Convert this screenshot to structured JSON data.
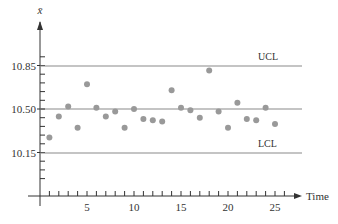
{
  "chart_data": {
    "type": "scatter",
    "title": "",
    "xlabel": "Time",
    "ylabel": "x̄",
    "xlim": [
      0,
      27
    ],
    "ylim": [
      9.9,
      11.1
    ],
    "x_ticks": [
      5,
      10,
      15,
      20,
      25
    ],
    "x_minor_ticks_step": 1,
    "y_ticks": [
      10.15,
      10.5,
      10.85
    ],
    "y_minor_ticks_step": 0.07,
    "grid": false,
    "legend": null,
    "reference_lines": [
      {
        "name": "UCL",
        "value": 10.83,
        "label": "UCL"
      },
      {
        "name": "CL",
        "value": 10.5,
        "label": ""
      },
      {
        "name": "LCL",
        "value": 10.17,
        "label": "LCL"
      }
    ],
    "series": [
      {
        "name": "sample means",
        "color": "#999999",
        "x": [
          1,
          2,
          3,
          4,
          5,
          6,
          7,
          8,
          9,
          10,
          11,
          12,
          13,
          14,
          15,
          16,
          17,
          18,
          19,
          20,
          21,
          22,
          23,
          24,
          25
        ],
        "values": [
          10.27,
          10.44,
          10.52,
          10.35,
          10.7,
          10.51,
          10.44,
          10.48,
          10.35,
          10.5,
          10.42,
          10.41,
          10.4,
          10.65,
          10.51,
          10.49,
          10.43,
          10.81,
          10.48,
          10.35,
          10.55,
          10.42,
          10.41,
          10.51,
          10.38
        ]
      }
    ]
  },
  "labels": {
    "y_axis": "x̄",
    "x_axis": "Time",
    "ucl": "UCL",
    "lcl": "LCL",
    "y_ticks": [
      "10.85",
      "10.50",
      "10.15"
    ],
    "x_ticks": [
      "5",
      "10",
      "15",
      "20",
      "25"
    ]
  },
  "colors": {
    "axis": "#333333",
    "control_line": "#8a8a8a",
    "point": "#999999"
  }
}
